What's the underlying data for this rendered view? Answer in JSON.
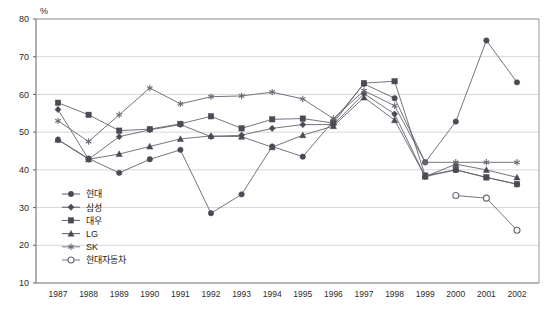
{
  "chart_data": {
    "type": "line",
    "title": "",
    "xlabel": "",
    "ylabel": "%",
    "unit_label": "%",
    "ylim": [
      10,
      80
    ],
    "ytick_step": 10,
    "yticks": [
      10,
      20,
      30,
      40,
      50,
      60,
      70,
      80
    ],
    "grid": true,
    "grid_axis": "y",
    "legend_position": "inside-bottom-left",
    "categories": [
      "1987",
      "1988",
      "1989",
      "1990",
      "1991",
      "1992",
      "1993",
      "1994",
      "1995",
      "1996",
      "1997",
      "1998",
      "1999",
      "2000",
      "2001",
      "2002"
    ],
    "x": [
      1987,
      1988,
      1989,
      1990,
      1991,
      1992,
      1993,
      1994,
      1995,
      1996,
      1997,
      1998,
      1999,
      2000,
      2001,
      2002
    ],
    "series": [
      {
        "name": "현대",
        "marker": "filled-circle",
        "color": "#4a4a55",
        "values": [
          48.0,
          43.0,
          39.2,
          42.8,
          45.3,
          28.5,
          33.5,
          46.2,
          43.5,
          53.0,
          62.8,
          59.0,
          42.0,
          52.8,
          74.3,
          63.2
        ]
      },
      {
        "name": "삼성",
        "marker": "filled-diamond",
        "color": "#4a4a55",
        "values": [
          56.0,
          42.8,
          48.8,
          50.6,
          52.0,
          48.8,
          49.2,
          51.0,
          52.0,
          52.0,
          60.2,
          54.8,
          38.2,
          40.0,
          38.0,
          36.2
        ]
      },
      {
        "name": "대우",
        "marker": "filled-square",
        "color": "#4a4a55",
        "values": [
          57.8,
          54.6,
          50.4,
          50.8,
          52.2,
          54.2,
          51.0,
          53.4,
          53.6,
          52.4,
          63.0,
          63.5,
          38.5,
          40.0,
          38.0,
          36.2
        ]
      },
      {
        "name": "LG",
        "marker": "filled-triangle",
        "color": "#4a4a55",
        "values": [
          48.0,
          42.8,
          44.2,
          46.2,
          48.2,
          49.0,
          48.8,
          46.0,
          49.2,
          51.6,
          59.2,
          53.2,
          38.2,
          41.5,
          40.0,
          38.0
        ]
      },
      {
        "name": "SK",
        "marker": "asterisk",
        "color": "#6a6a75",
        "values": [
          53.0,
          47.5,
          54.6,
          61.7,
          57.5,
          59.4,
          59.6,
          60.6,
          58.8,
          53.6,
          61.0,
          57.0,
          42.0,
          42.0,
          42.0,
          42.0
        ]
      },
      {
        "name": "현대자동차",
        "marker": "open-circle",
        "color": "#6a6a75",
        "values": [
          null,
          null,
          null,
          null,
          null,
          null,
          null,
          null,
          null,
          null,
          null,
          null,
          null,
          33.2,
          32.5,
          24.0
        ]
      }
    ],
    "legend_entries": [
      {
        "label": "현대",
        "marker": "filled-circle"
      },
      {
        "label": "삼성",
        "marker": "filled-diamond"
      },
      {
        "label": "대우",
        "marker": "filled-square"
      },
      {
        "label": "LG",
        "marker": "filled-triangle"
      },
      {
        "label": "SK",
        "marker": "asterisk"
      },
      {
        "label": "현대자동차",
        "marker": "open-circle"
      }
    ]
  }
}
